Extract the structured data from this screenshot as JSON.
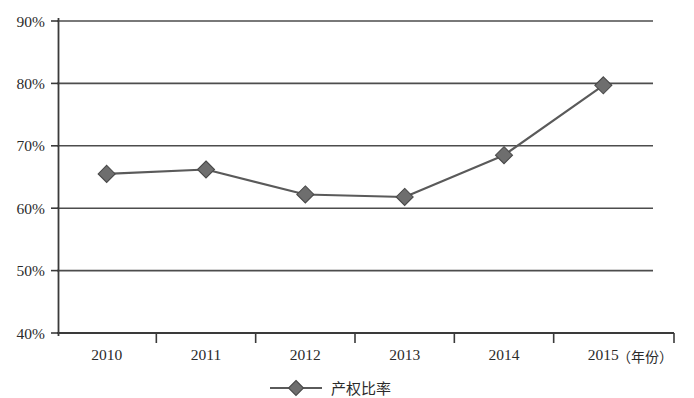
{
  "chart_data": {
    "type": "line",
    "title": "",
    "subtitle": "",
    "xlabel": "（年份）",
    "ylabel": "",
    "categories": [
      "2010",
      "2011",
      "2012",
      "2013",
      "2014",
      "2015"
    ],
    "series": [
      {
        "name": "产权比率",
        "values": [
          65.5,
          66.2,
          62.2,
          61.8,
          68.5,
          79.7
        ],
        "marker": "diamond",
        "color": "#5a5a5a"
      }
    ],
    "ylim": [
      40,
      90
    ],
    "ytick_labels": [
      "40%",
      "50%",
      "60%",
      "70%",
      "80%",
      "90%"
    ],
    "ytick_values": [
      40,
      50,
      60,
      70,
      80,
      90
    ],
    "grid": "horizontal",
    "legend_position": "bottom-center",
    "legend_entries": [
      "产权比率"
    ],
    "annotations": []
  },
  "axes": {
    "x_axis_label": "（年份）",
    "y_axis_format": "percent"
  },
  "legend": {
    "label": "产权比率",
    "marker_shape": "diamond",
    "line_color": "#5a5a5a"
  },
  "colors": {
    "line": "#5a5a5a",
    "marker_fill": "#6e6e6e",
    "marker_stroke": "#4a4a4a",
    "gridline": "#4d4d4d",
    "axis": "#3a3a3a",
    "background": "#ffffff",
    "text": "#2b2b2b"
  }
}
